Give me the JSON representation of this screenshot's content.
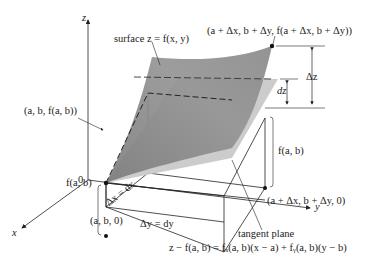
{
  "diagram": {
    "colors": {
      "surface": "#8f8f8f",
      "surface_light": "#b5b5b5",
      "tangent_plane": "#c8c8c8",
      "lines": "#222222",
      "background": "#ffffff"
    },
    "axes": {
      "z_label": "z",
      "y_label": "y",
      "x_label": "x",
      "origin_label": "0"
    },
    "labels": {
      "surface": "surface z = f(x, y)",
      "point_top_left": "(a, b, f(a, b))",
      "point_top_right": "(a + Δx, b + Δy, f(a + Δx, b + Δy))",
      "delta_z": "Δz",
      "dz": "dz",
      "f_ab_right": "f(a, b)",
      "f_ab_left": "f(a, b)",
      "delta_x": "Δx = dx",
      "delta_y": "Δy = dy",
      "point_base_left": "(a, b, 0)",
      "point_base_right": "(a + Δx, b + Δy, 0)",
      "tangent_plane": "tangent plane",
      "tangent_equation": "z − f(a, b) = fₓ(a, b)(x − a) + fᵧ(a, b)(y − b)"
    }
  }
}
